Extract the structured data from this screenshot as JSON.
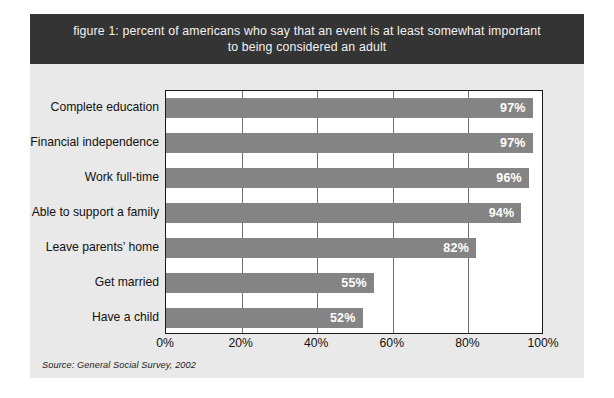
{
  "figure": {
    "title": "figure 1: percent of americans who say that an event is at least somewhat important\nto being considered an adult",
    "source_note": "Source: General Social Survey, 2002",
    "colors": {
      "band_background": "#343434",
      "band_text": "#f2f2f2",
      "card_background": "#e9e9e9",
      "plot_background": "#ffffff",
      "bar_fill": "#848484",
      "bar_label_text": "#ffffff",
      "axis_line": "#1a1a1a",
      "gridline": "#6f6f6f"
    }
  },
  "chart_data": {
    "type": "bar",
    "orientation": "horizontal",
    "title": "figure 1: percent of americans who say that an event is at least somewhat important to being considered an adult",
    "xlabel": "",
    "ylabel": "",
    "xlim": [
      0,
      100
    ],
    "xticks": [
      "0%",
      "20%",
      "40%",
      "60%",
      "80%",
      "100%"
    ],
    "xtick_values": [
      0,
      20,
      40,
      60,
      80,
      100
    ],
    "grid": true,
    "grid_axis": "x",
    "legend": false,
    "categories": [
      "Complete education",
      "Financial independence",
      "Work full-time",
      "Able to support a family",
      "Leave parents’ home",
      "Get married",
      "Have a child"
    ],
    "values": [
      97,
      97,
      96,
      94,
      82,
      55,
      52
    ],
    "value_labels": [
      "97%",
      "97%",
      "96%",
      "94%",
      "82%",
      "55%",
      "52%"
    ],
    "source": "General Social Survey, 2002"
  }
}
